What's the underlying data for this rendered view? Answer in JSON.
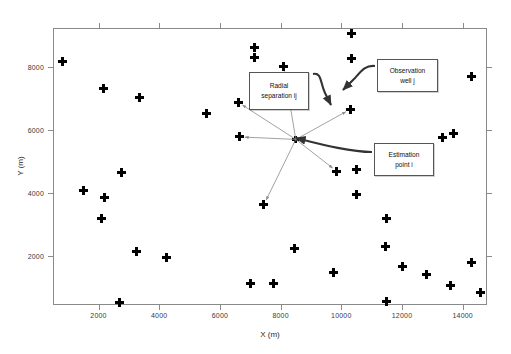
{
  "chart_data": {
    "type": "scatter",
    "title": "",
    "xlabel": "X (m)",
    "ylabel": "Y (m)",
    "xlim": [
      500,
      14800
    ],
    "ylim": [
      450,
      9250
    ],
    "xticks": [
      2000,
      4000,
      6000,
      8000,
      10000,
      12000,
      14000
    ],
    "yticks": [
      2000,
      4000,
      6000,
      8000
    ],
    "xticklabels": [
      "2000",
      "4000",
      "6000",
      "8000",
      "10000",
      "12000",
      "14000"
    ],
    "yticklabels": [
      "2000",
      "4000",
      "6000",
      "8000"
    ],
    "grid": false,
    "legend": null,
    "marker": "plus",
    "marker_color": "#000000",
    "series": [
      {
        "name": "Observation wells",
        "points": [
          [
            800,
            8200
          ],
          [
            2150,
            7340
          ],
          [
            3350,
            7050
          ],
          [
            5550,
            6530
          ],
          [
            6600,
            6890
          ],
          [
            7150,
            8620
          ],
          [
            7150,
            8300
          ],
          [
            8100,
            8030
          ],
          [
            10350,
            9060
          ],
          [
            10350,
            8270
          ],
          [
            6650,
            5790
          ],
          [
            10300,
            6670
          ],
          [
            14300,
            7700
          ],
          [
            13350,
            5780
          ],
          [
            13700,
            5900
          ],
          [
            10500,
            4760
          ],
          [
            9850,
            4700
          ],
          [
            10500,
            3950
          ],
          [
            11500,
            3190
          ],
          [
            11450,
            2310
          ],
          [
            12000,
            1660
          ],
          [
            12800,
            1410
          ],
          [
            13600,
            1060
          ],
          [
            14300,
            1810
          ],
          [
            14600,
            860
          ],
          [
            11500,
            570
          ],
          [
            9750,
            1490
          ],
          [
            8450,
            2250
          ],
          [
            7000,
            1120
          ],
          [
            7750,
            1120
          ],
          [
            4250,
            1960
          ],
          [
            3250,
            2140
          ],
          [
            2700,
            540
          ],
          [
            2100,
            3200
          ],
          [
            2200,
            3880
          ],
          [
            1500,
            4100
          ],
          [
            2750,
            4650
          ],
          [
            7450,
            3640
          ]
        ]
      },
      {
        "name": "Estimation point i",
        "points": [
          [
            8500,
            5710
          ]
        ]
      }
    ],
    "annotations": [
      {
        "name": "radial-separation-callout",
        "lines": [
          "Radial",
          "separation ij"
        ],
        "points_to": "ray-lines-from-estimation-point"
      },
      {
        "name": "observation-well-callout",
        "lines": [
          "Observation",
          "well j"
        ],
        "points_to": [
          10300,
          6670
        ]
      },
      {
        "name": "estimation-point-callout",
        "lines": [
          "Estimation",
          "point i"
        ],
        "points_to": [
          8500,
          5710
        ]
      }
    ],
    "rays_from_estimation_point": [
      [
        6650,
        5790
      ],
      [
        10300,
        6670
      ],
      [
        8100,
        8030
      ],
      [
        6600,
        6890
      ],
      [
        7450,
        3640
      ],
      [
        9850,
        4700
      ]
    ]
  },
  "labels": {
    "xlabel": "X (m)",
    "ylabel": "Y (m)",
    "callout_radial_line1": "Radial",
    "callout_radial_line2": "separation ij",
    "callout_obs_line1": "Observation",
    "callout_obs_line2": "well j",
    "callout_est_line1": "Estimation",
    "callout_est_line2": "point i"
  },
  "colors": {
    "marker": "#000000",
    "axis": "#8a8a8a",
    "callout_border": "#555555",
    "ray": "#8a8a8a",
    "arrow": "#333333",
    "background": "#ffffff"
  }
}
